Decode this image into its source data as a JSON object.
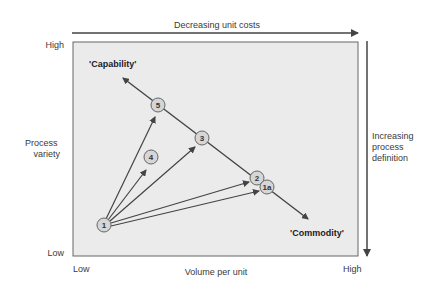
{
  "top_axis": {
    "label": "Decreasing unit costs"
  },
  "right_axis": {
    "label_lines": [
      "Increasing",
      "process",
      "definition"
    ]
  },
  "y_axis": {
    "label_lines": [
      "Process",
      "variety"
    ],
    "high": "High",
    "low": "Low"
  },
  "x_axis": {
    "label": "Volume per unit",
    "low": "Low",
    "high": "High"
  },
  "diagonal": {
    "start_label": "'Capability'",
    "end_label": "'Commodity'"
  },
  "nodes": [
    {
      "id": "1",
      "label": "1",
      "x": 104,
      "y": 225
    },
    {
      "id": "4",
      "label": "4",
      "x": 151,
      "y": 157
    },
    {
      "id": "5",
      "label": "5",
      "x": 158,
      "y": 105
    },
    {
      "id": "3",
      "label": "3",
      "x": 202,
      "y": 138
    },
    {
      "id": "2",
      "label": "2",
      "x": 257,
      "y": 178
    },
    {
      "id": "1a",
      "label": "1a",
      "x": 267,
      "y": 187
    }
  ],
  "colors": {
    "plot_bg": "#ebebeb",
    "line": "#555555",
    "node_fill": "#d6d6d6",
    "node_stroke": "#666666"
  }
}
